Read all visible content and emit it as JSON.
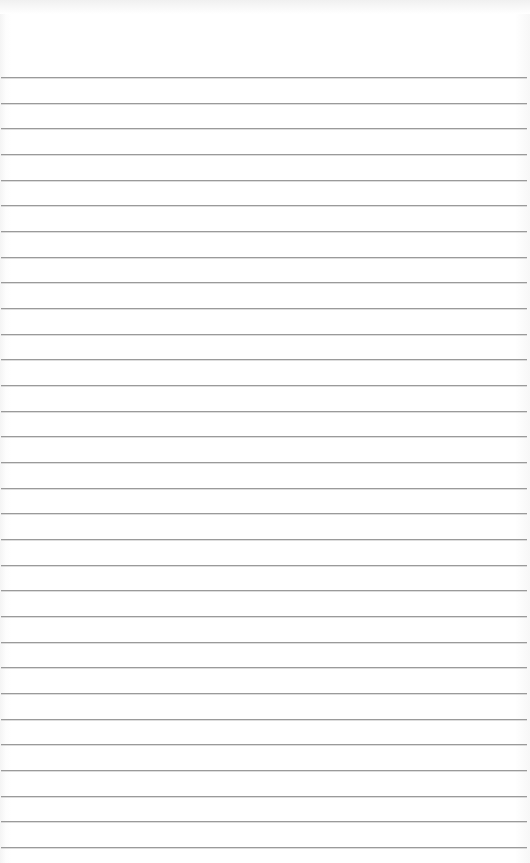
{
  "image": {
    "description": "lined paper texture",
    "background_color": "#ffffff",
    "line_color": "#9a9a9a",
    "line_count": 31,
    "first_line_y": 77,
    "line_spacing": 25.67
  }
}
